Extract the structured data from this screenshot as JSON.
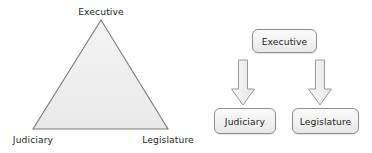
{
  "figure": {
    "type": "two-panel-diagram",
    "background_color": "#ffffff",
    "text_color": "#231f20",
    "shape_fill": "#efefef",
    "shape_stroke": "#8d8d8d"
  },
  "triangle_diagram": {
    "name": "separation-of-powers-triangle",
    "shape": "triangle",
    "fill_color": "#efefef",
    "stroke_color": "#7a7a7a",
    "vertices": [
      {
        "id": "apex",
        "label": "Executive",
        "label_position": "above"
      },
      {
        "id": "bottom-left",
        "label": "Judiciary",
        "label_position": "below"
      },
      {
        "id": "bottom-right",
        "label": "Legislature",
        "label_position": "below"
      }
    ]
  },
  "flow_diagram": {
    "name": "separation-of-powers-flowchart",
    "boxes": [
      {
        "id": "executive",
        "label": "Executive",
        "row": "top"
      },
      {
        "id": "judiciary",
        "label": "Judiciary",
        "row": "bottom"
      },
      {
        "id": "legislature",
        "label": "Legislature",
        "row": "bottom"
      }
    ],
    "arrows": [
      {
        "id": "executive-to-judiciary",
        "from": "Executive",
        "to": "Judiciary",
        "direction": "down"
      },
      {
        "id": "executive-to-legislature",
        "from": "Executive",
        "to": "Legislature",
        "direction": "down"
      }
    ]
  }
}
